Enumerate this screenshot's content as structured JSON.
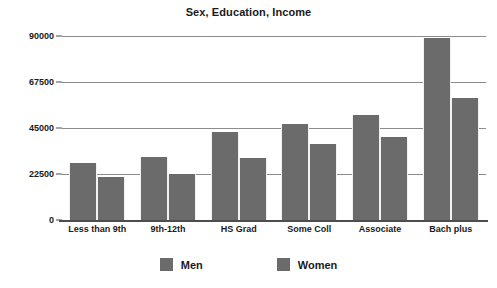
{
  "chart_data": {
    "type": "bar",
    "title": "Sex, Education, Income",
    "xlabel": "",
    "ylabel": "",
    "categories": [
      "Less than 9th",
      "9th-12th",
      "HS Grad",
      "Some Coll",
      "Associate",
      "Bach plus"
    ],
    "series": [
      {
        "name": "Men",
        "values": [
          27900,
          30800,
          43000,
          47000,
          51400,
          89000
        ],
        "color": "#6b6b6b"
      },
      {
        "name": "Women",
        "values": [
          21000,
          22700,
          30300,
          37200,
          40600,
          59700
        ],
        "color": "#6b6b6b"
      }
    ],
    "ylim": [
      0,
      90000
    ],
    "yticks": [
      0,
      22500,
      45000,
      67500,
      90000
    ],
    "ytick_labels": [
      "0",
      "22500",
      "45000",
      "67500",
      "90000"
    ],
    "grid": true,
    "grid_axis": "y",
    "legend_position": "bottom",
    "bar_mode": "grouped"
  },
  "legend": {
    "items": [
      {
        "label": "Men",
        "color": "#6b6b6b"
      },
      {
        "label": "Women",
        "color": "#6b6b6b"
      }
    ]
  },
  "colors": {
    "bar_fill": "#6b6b6b",
    "gridline": "#8c8c8c",
    "axis": "#4d4d4d",
    "text": "#1a1a1a",
    "background": "#ffffff"
  }
}
